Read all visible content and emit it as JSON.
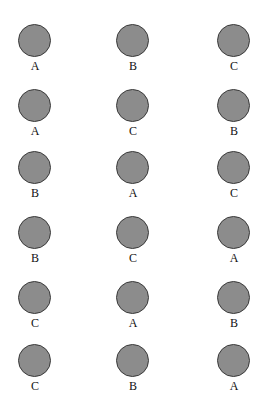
{
  "diagram": {
    "type": "circle-grid",
    "circle_color": "#8c8c8c",
    "circle_border": "#3a3a3a",
    "rows": [
      [
        "A",
        "B",
        "C"
      ],
      [
        "A",
        "C",
        "B"
      ],
      [
        "B",
        "A",
        "C"
      ],
      [
        "B",
        "C",
        "A"
      ],
      [
        "C",
        "A",
        "B"
      ],
      [
        "C",
        "B",
        "A"
      ]
    ]
  }
}
